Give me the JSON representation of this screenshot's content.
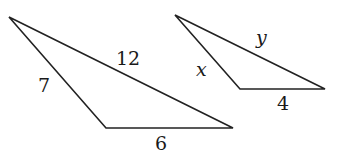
{
  "diagram": {
    "type": "similar-triangles",
    "triangles": [
      {
        "id": "large",
        "vertices": [
          [
            9,
            17
          ],
          [
            106,
            128
          ],
          [
            233,
            128
          ]
        ],
        "sides": [
          {
            "name": "left",
            "label": "7",
            "label_pos": [
              38,
              92
            ]
          },
          {
            "name": "top",
            "label": "12",
            "label_pos": [
              116,
              65
            ]
          },
          {
            "name": "bottom",
            "label": "6",
            "label_pos": [
              155,
              150
            ]
          }
        ]
      },
      {
        "id": "small",
        "vertices": [
          [
            175,
            15
          ],
          [
            240,
            89
          ],
          [
            325,
            89
          ]
        ],
        "sides": [
          {
            "name": "left",
            "label": "x",
            "label_pos": [
              196,
              76
            ],
            "italic": true
          },
          {
            "name": "top",
            "label": "y",
            "label_pos": [
              256,
              44
            ],
            "italic": true
          },
          {
            "name": "bottom",
            "label": "4",
            "label_pos": [
              277,
              110
            ]
          }
        ]
      }
    ],
    "colors": {
      "stroke": "#222222",
      "text": "#1a1a1a",
      "background": "#ffffff"
    }
  }
}
